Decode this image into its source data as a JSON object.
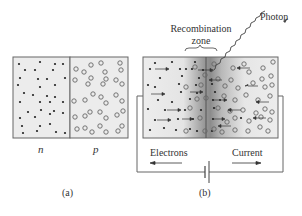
{
  "figure": {
    "panel_a": {
      "caption": "(a)",
      "n_label": "n",
      "p_label": "p"
    },
    "panel_b": {
      "caption": "(b)",
      "recombination_label_line1": "Recombination",
      "recombination_label_line2": "zone",
      "photon_label": "Photon",
      "electrons_label": "Electrons",
      "current_label": "Current"
    },
    "colors": {
      "line": "#555555",
      "box_fill": "#ebebeb",
      "dot": "#222222",
      "hole": "#666666",
      "gradient_dark": "#8a8a8a"
    }
  }
}
